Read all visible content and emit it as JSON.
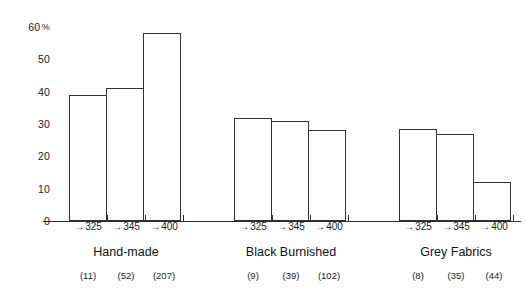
{
  "chart_data": {
    "type": "bar",
    "title": "",
    "xlabel": "",
    "ylabel": "%",
    "ylim": [
      0,
      60
    ],
    "grid": false,
    "legend": "none",
    "y_ticks": [
      {
        "value": 60,
        "label": "60",
        "suffix": "%"
      },
      {
        "value": 50,
        "label": "50",
        "suffix": ""
      },
      {
        "value": 40,
        "label": "40",
        "suffix": ""
      },
      {
        "value": 30,
        "label": "30",
        "suffix": ""
      },
      {
        "value": 20,
        "label": "20",
        "suffix": ""
      },
      {
        "value": 10,
        "label": "10",
        "suffix": ""
      },
      {
        "value": 0,
        "label": "0",
        "suffix": ""
      }
    ],
    "bin_labels": [
      "325",
      "345",
      "400"
    ],
    "bin_arrow": "→",
    "categories": [
      "325",
      "345",
      "400"
    ],
    "groups": [
      {
        "name": "Hand-made",
        "bins": [
          "325",
          "345",
          "400"
        ],
        "values": [
          39,
          41,
          58
        ],
        "counts": [
          "(11)",
          "(52)",
          "(207)"
        ],
        "count_values": [
          11,
          52,
          207
        ]
      },
      {
        "name": "Black Burnished",
        "bins": [
          "325",
          "345",
          "400"
        ],
        "values": [
          32,
          31,
          28
        ],
        "counts": [
          "(9)",
          "(39)",
          "(102)"
        ],
        "count_values": [
          9,
          39,
          102
        ]
      },
      {
        "name": "Grey Fabrics",
        "bins": [
          "325",
          "345",
          "400"
        ],
        "values": [
          28.5,
          27,
          12
        ],
        "counts": [
          "(8)",
          "(35)",
          "(44)"
        ],
        "count_values": [
          8,
          35,
          44
        ]
      }
    ]
  },
  "style": {
    "bar_fill": "#ffffff",
    "bar_stroke": "#333333",
    "axis_color": "#2b2b2b",
    "text_color": "#1c1c1c",
    "background": "#ffffff"
  }
}
